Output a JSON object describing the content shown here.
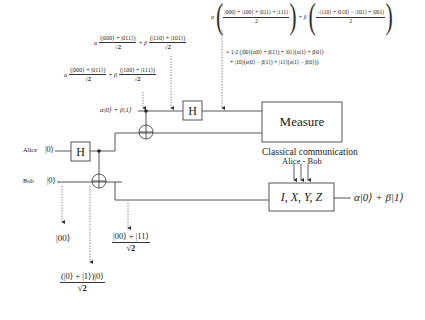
{
  "diagram": {
    "qubits": {
      "input_state": "α|0⟩ + β|1⟩",
      "alice": {
        "label": "Alice",
        "initial_state": "|0⟩"
      },
      "bob": {
        "label": "Bob",
        "initial_state": "|0⟩"
      }
    },
    "gates": {
      "h_alice": "H",
      "h_input": "H",
      "measure": "Measure",
      "correction": "I, X, Y, Z"
    },
    "classical": {
      "label": "Classical communication",
      "direction": "Alice - Bob"
    },
    "output_state": "α|0⟩ + β|1⟩",
    "annotations": {
      "state_00": "|00⟩",
      "state_superposition_num": "(|0⟩ + |1⟩)|0⟩",
      "state_superposition_den": "√2",
      "bell_num": "|00⟩ + |11⟩",
      "bell_den": "√2",
      "after_cnot2": {
        "alpha": "α",
        "alpha_num": "(|000⟩ + |011⟩)",
        "den": "√2",
        "plus_beta": "+ β",
        "beta_num": "(|100⟩ + |111⟩)"
      },
      "after_cnot3": {
        "alpha": "α",
        "alpha_num": "(|000⟩ + |011⟩)",
        "den": "√2",
        "plus_beta": "+ β",
        "beta_num": "(|110⟩ + |101⟩)"
      },
      "after_h": {
        "alpha": "α",
        "alpha_num": "|000⟩ + |100⟩ + |011⟩ + |111⟩",
        "alpha_den": "2",
        "plus_beta": "+ β",
        "beta_num": "−|110⟩ + |010⟩ − |101⟩ + |001⟩",
        "beta_den": "2"
      },
      "regrouped_line1": "= 1/2 (|00⟩(α|0⟩ + β|1⟩) + |01⟩(α|1⟩ + β|0⟩)",
      "regrouped_line2": "+ |10⟩(α|0⟩ − β|1⟩) + |11⟩(α|1⟩ − β|0⟩))"
    },
    "colors": {
      "line": "#444444",
      "text": "#222222",
      "background": "#ffffff"
    }
  }
}
